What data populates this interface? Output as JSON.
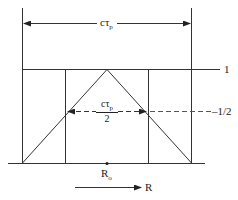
{
  "diagram": {
    "type": "pulse range profile",
    "labels": {
      "full_width": {
        "main": "cτ",
        "sub": "p"
      },
      "half_width": {
        "num_main": "cτ",
        "num_sub": "p",
        "den": "2"
      },
      "level_one": "1",
      "level_half": "–1/2",
      "center": {
        "main": "R",
        "sub": "o"
      },
      "axis": "R"
    },
    "colors": {
      "line": "#333333",
      "dash": "#555555",
      "background": "#ffffff"
    }
  }
}
